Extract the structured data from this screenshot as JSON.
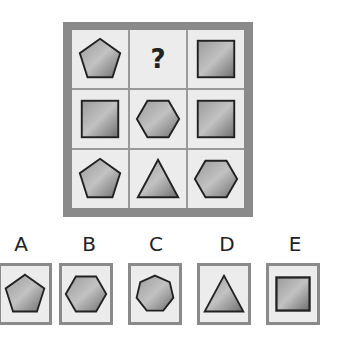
{
  "puzzle": {
    "question_mark": "?",
    "grid": [
      [
        "pentagon",
        "unknown",
        "square"
      ],
      [
        "square",
        "hexagon",
        "square"
      ],
      [
        "pentagon",
        "triangle",
        "hexagon"
      ]
    ],
    "colors": {
      "frame": "#8a8a8a",
      "cell_bg": "#ececec",
      "shape_fill_light": "#b5b5b5",
      "shape_fill_dark": "#6e6e6e",
      "shape_stroke": "#222222"
    }
  },
  "options": [
    {
      "label": "A",
      "shape": "pentagon"
    },
    {
      "label": "B",
      "shape": "hexagon"
    },
    {
      "label": "C",
      "shape": "heptagon"
    },
    {
      "label": "D",
      "shape": "triangle"
    },
    {
      "label": "E",
      "shape": "square"
    }
  ]
}
